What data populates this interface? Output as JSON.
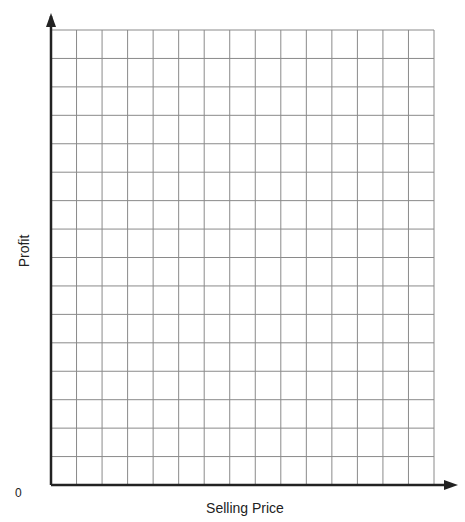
{
  "chart_data": {
    "type": "line",
    "title": "",
    "xlabel": "Selling Price",
    "ylabel": "Profit",
    "origin_label": "0",
    "grid": true,
    "grid_columns": 15,
    "grid_rows": 16,
    "series": [],
    "axis_arrows": true
  },
  "colors": {
    "grid": "#8a8a8a",
    "axis": "#222222"
  }
}
